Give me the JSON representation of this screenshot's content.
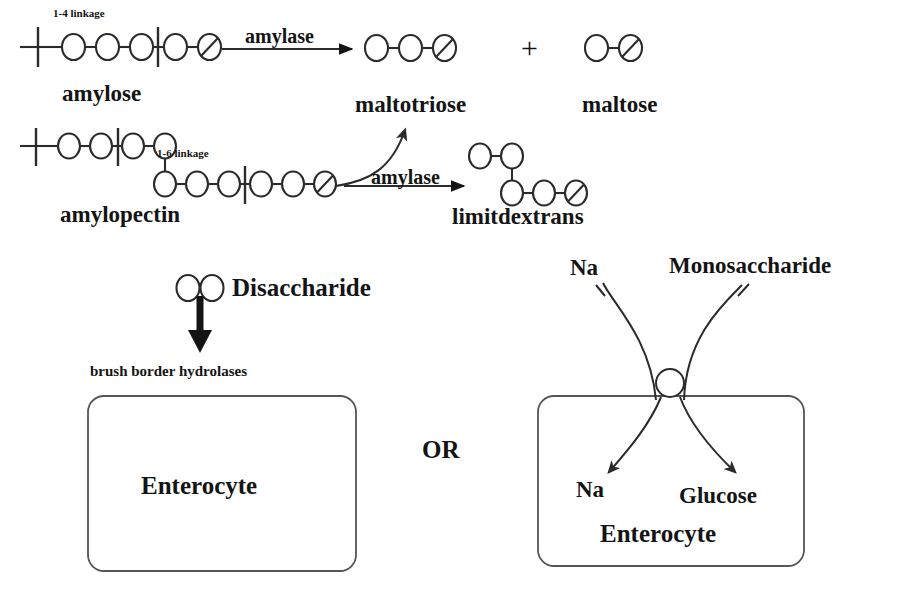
{
  "figure": {
    "background_color": "#ffffff",
    "ink_color": "#141414"
  },
  "labels": {
    "linkage_1_4": "1-4 linkage",
    "linkage_1_6": "1-6 linkage",
    "amylose": "amylose",
    "amylopectin": "amylopectin",
    "amylase_top": "amylase",
    "amylase_bottom": "amylase",
    "maltotriose": "maltotriose",
    "maltose": "maltose",
    "plus": "+",
    "limitdextrans": "limitdextrans",
    "disaccharide": "Disaccharide",
    "brush_border_hydrolases": "brush border hydrolases",
    "enterocyte_left": "Enterocyte",
    "enterocyte_right": "Enterocyte",
    "or": "OR",
    "na_outside": "Na",
    "monosaccharide": "Monosaccharide",
    "na_inside": "Na",
    "glucose": "Glucose"
  },
  "structures": {
    "amylose": {
      "name": "amylose",
      "residue_count": 5,
      "reducing_end": "slashed-circle",
      "nonreducing_end": "open-line-with-tick",
      "cut_marks": 2,
      "linkage": "1-4 linkage"
    },
    "amylopectin": {
      "name": "amylopectin",
      "top_chain_residues": 4,
      "bottom_chain_residues": 6,
      "branch": "1-6 linkage",
      "reducing_end": "slashed-circle",
      "cut_marks": 3
    },
    "maltotriose": {
      "name": "maltotriose",
      "residue_count": 3,
      "reducing_end": "slashed-circle"
    },
    "maltose": {
      "name": "maltose",
      "residue_count": 2,
      "reducing_end": "slashed-circle"
    },
    "limitdextrans": {
      "name": "limitdextrans",
      "top_chain_residues": 2,
      "bottom_chain_residues": 3,
      "branch": "1-6 linkage",
      "reducing_end": "slashed-circle"
    },
    "disaccharide": {
      "name": "Disaccharide",
      "residue_count": 2
    }
  },
  "transport": {
    "carrier": "sglt-transporter",
    "substrates_in": [
      "Na",
      "Monosaccharide"
    ],
    "products_in": [
      "Na",
      "Glucose"
    ]
  }
}
